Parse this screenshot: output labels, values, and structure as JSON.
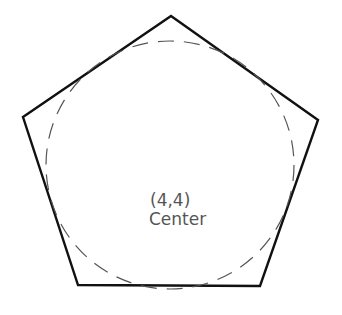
{
  "diagram": {
    "pentagon": {
      "points": "171,16 318,120 260,286 78,285 23,117",
      "stroke": "#111111",
      "stroke_width": 2.4
    },
    "inscribed_circle": {
      "cx": 170,
      "cy": 165,
      "r": 124,
      "stroke": "#555555",
      "dash": "16 10"
    },
    "center_label": {
      "coordinates": "(4,4)",
      "text": "Center"
    }
  }
}
